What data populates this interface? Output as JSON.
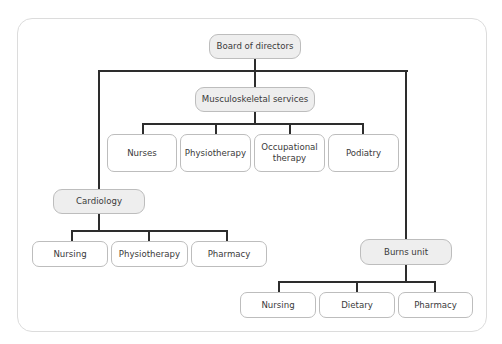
{
  "diagram": {
    "type": "org-chart",
    "root": {
      "label": "Board of directors"
    },
    "departments": {
      "musculoskeletal": {
        "label": "Musculoskeletal services",
        "children": [
          "Nurses",
          "Physiotherapy",
          "Occupational therapy",
          "Podiatry"
        ]
      },
      "cardiology": {
        "label": "Cardiology",
        "children": [
          "Nursing",
          "Physiotherapy",
          "Pharmacy"
        ]
      },
      "burns": {
        "label": "Burns unit",
        "children": [
          "Nursing",
          "Dietary",
          "Pharmacy"
        ]
      }
    },
    "colors": {
      "parent_fill": "#eeeeee",
      "child_fill": "#ffffff",
      "border": "#bdbdbd",
      "connector": "#2d2d2d",
      "text": "#3a3a3a"
    }
  }
}
